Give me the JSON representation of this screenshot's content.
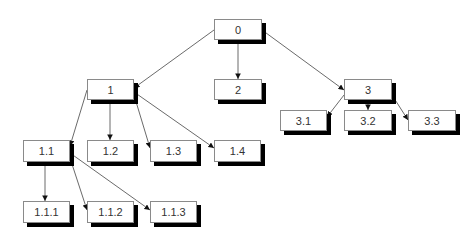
{
  "diagram": {
    "type": "tree",
    "nodes": [
      {
        "id": "0",
        "label": "0",
        "x": 214,
        "y": 19,
        "w": 48,
        "h": 21
      },
      {
        "id": "1",
        "label": "1",
        "x": 87,
        "y": 79,
        "w": 47,
        "h": 21
      },
      {
        "id": "2",
        "label": "2",
        "x": 214,
        "y": 79,
        "w": 48,
        "h": 21
      },
      {
        "id": "3",
        "label": "3",
        "x": 344,
        "y": 79,
        "w": 48,
        "h": 21
      },
      {
        "id": "1.1",
        "label": "1.1",
        "x": 23,
        "y": 140,
        "w": 47,
        "h": 22
      },
      {
        "id": "1.2",
        "label": "1.2",
        "x": 87,
        "y": 140,
        "w": 47,
        "h": 22
      },
      {
        "id": "1.3",
        "label": "1.3",
        "x": 150,
        "y": 140,
        "w": 47,
        "h": 22
      },
      {
        "id": "1.4",
        "label": "1.4",
        "x": 214,
        "y": 140,
        "w": 47,
        "h": 22
      },
      {
        "id": "3.1",
        "label": "3.1",
        "x": 280,
        "y": 110,
        "w": 47,
        "h": 21
      },
      {
        "id": "3.2",
        "label": "3.2",
        "x": 344,
        "y": 110,
        "w": 48,
        "h": 21
      },
      {
        "id": "3.3",
        "label": "3.3",
        "x": 408,
        "y": 110,
        "w": 48,
        "h": 21
      },
      {
        "id": "1.1.1",
        "label": "1.1.1",
        "x": 23,
        "y": 201,
        "w": 47,
        "h": 22
      },
      {
        "id": "1.1.2",
        "label": "1.1.2",
        "x": 87,
        "y": 201,
        "w": 47,
        "h": 22
      },
      {
        "id": "1.1.3",
        "label": "1.1.3",
        "x": 150,
        "y": 201,
        "w": 47,
        "h": 22
      }
    ],
    "edges": [
      {
        "from": "0",
        "to": "1",
        "x1": 214,
        "y1": 30,
        "x2": 134,
        "y2": 88
      },
      {
        "from": "0",
        "to": "2",
        "x1": 238,
        "y1": 40,
        "x2": 238,
        "y2": 79
      },
      {
        "from": "0",
        "to": "3",
        "x1": 262,
        "y1": 30,
        "x2": 344,
        "y2": 90
      },
      {
        "from": "1",
        "to": "1.1",
        "x1": 87,
        "y1": 90,
        "x2": 70,
        "y2": 146
      },
      {
        "from": "1",
        "to": "1.2",
        "x1": 110,
        "y1": 100,
        "x2": 110,
        "y2": 140
      },
      {
        "from": "1",
        "to": "1.3",
        "x1": 134,
        "y1": 95,
        "x2": 150,
        "y2": 148
      },
      {
        "from": "1",
        "to": "1.4",
        "x1": 134,
        "y1": 92,
        "x2": 214,
        "y2": 148
      },
      {
        "from": "3",
        "to": "3.1",
        "x1": 344,
        "y1": 95,
        "x2": 327,
        "y2": 117
      },
      {
        "from": "3",
        "to": "3.2",
        "x1": 368,
        "y1": 100,
        "x2": 368,
        "y2": 110
      },
      {
        "from": "3",
        "to": "3.3",
        "x1": 392,
        "y1": 95,
        "x2": 408,
        "y2": 120
      },
      {
        "from": "1.1",
        "to": "1.1.1",
        "x1": 45,
        "y1": 162,
        "x2": 45,
        "y2": 201
      },
      {
        "from": "1.1",
        "to": "1.1.2",
        "x1": 70,
        "y1": 158,
        "x2": 87,
        "y2": 210
      },
      {
        "from": "1.1",
        "to": "1.1.3",
        "x1": 70,
        "y1": 153,
        "x2": 150,
        "y2": 210
      }
    ],
    "colors": {
      "box_fill": "#ffffff",
      "box_border": "#8a8a8a",
      "shadow": "#000000",
      "edge": "#444444",
      "text": "#333333"
    }
  }
}
